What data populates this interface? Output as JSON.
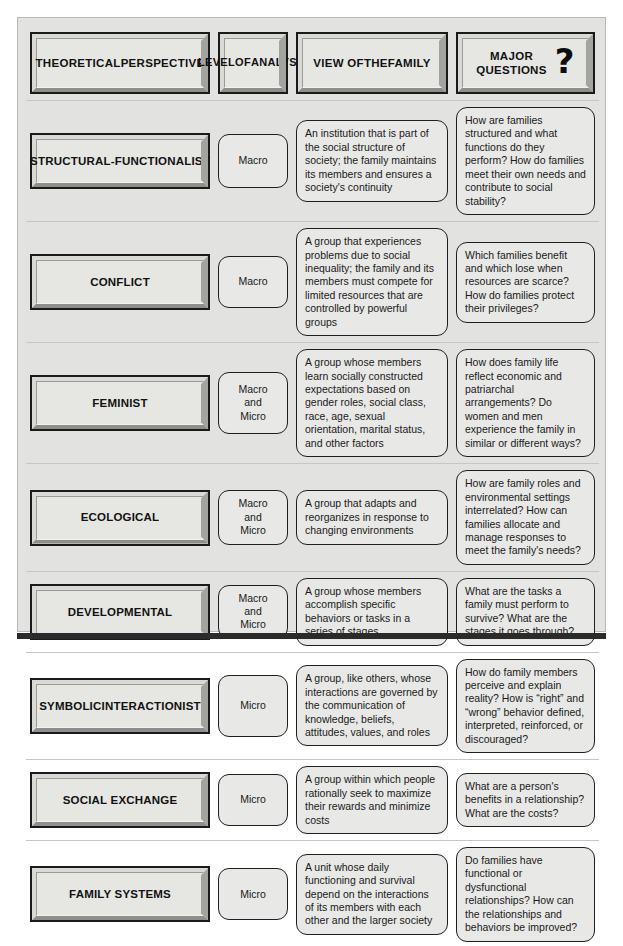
{
  "figure": {
    "colors": {
      "frame_background": "#e2e2e0",
      "box_face": "#e6e6e3",
      "box_border": "#1a1a1a",
      "pill_face": "#e8e8e6",
      "bottom_rule": "#2b2b2b"
    }
  },
  "header": {
    "columns": [
      {
        "label": "THEORETICAL\nPERSPECTIVE",
        "line1": "THEORETICAL",
        "line2": "PERSPECTIVE"
      },
      {
        "label": "LEVEL\nOF\nANALYSIS",
        "line1": "LEVEL",
        "line2": "OF",
        "line3": "ANALYSIS"
      },
      {
        "label": "VIEW OF\nTHE\nFAMILY",
        "line1": "VIEW OF",
        "line2": "THE",
        "line3": "FAMILY"
      },
      {
        "label": "MAJOR\nQUESTIONS",
        "line1": "MAJOR",
        "line2": "QUESTIONS",
        "icon": "question-mark-icon",
        "icon_glyph": "?"
      }
    ]
  },
  "rows": [
    {
      "perspective_line1": "STRUCTURAL-",
      "perspective_line2": "FUNCTIONALIST",
      "level": "Macro",
      "view": "An institution that is part of the social structure of society; the family maintains its members and ensures a society's continuity",
      "questions": "How are families structured and what functions do they perform? How do families meet their own needs and contribute to social stability?"
    },
    {
      "perspective_line1": "CONFLICT",
      "perspective_line2": "",
      "level": "Macro",
      "view": "A group that experiences problems due to social inequality; the family and its members must compete for limited resources that are controlled by powerful groups",
      "questions": "Which families benefit and which lose when resources are scarce? How do families protect their privileges?"
    },
    {
      "perspective_line1": "FEMINIST",
      "perspective_line2": "",
      "level": "Macro\nand\nMicro",
      "view": "A group whose members learn socially constructed expectations based on gender roles, social class, race, age, sexual orientation, marital status, and other factors",
      "questions": "How does family life reflect economic and patriarchal arrangements? Do women and men experience the family in similar or different ways?"
    },
    {
      "perspective_line1": "ECOLOGICAL",
      "perspective_line2": "",
      "level": "Macro\nand\nMicro",
      "view": "A group that adapts and reorganizes in response to changing environments",
      "questions": "How are family roles and environmental settings interrelated? How can families allocate and manage responses to meet the family's needs?"
    },
    {
      "perspective_line1": "DEVELOPMENTAL",
      "perspective_line2": "",
      "level": "Macro\nand\nMicro",
      "view": "A group whose members accomplish specific behaviors or tasks in a series of stages",
      "questions": "What are the tasks a family must perform to survive? What are the stages it goes through?"
    },
    {
      "perspective_line1": "SYMBOLIC",
      "perspective_line2": "INTERACTIONIST",
      "level": "Micro",
      "view": "A group, like others, whose interactions are governed by the communication of knowledge, beliefs, attitudes, values, and roles",
      "questions": "How do family members perceive and explain reality? How is “right” and “wrong” behavior defined, interpreted, reinforced, or discouraged?"
    },
    {
      "perspective_line1": "SOCIAL EXCHANGE",
      "perspective_line2": "",
      "level": "Micro",
      "view": "A group within which people rationally seek to maximize their rewards and minimize costs",
      "questions": "What are a person's benefits in a relationship? What are the costs?"
    },
    {
      "perspective_line1": "FAMILY SYSTEMS",
      "perspective_line2": "",
      "level": "Micro",
      "view": "A unit whose daily functioning and survival depend on the interactions of its members with each other and the larger society",
      "questions": "Do families have functional or dysfunctional relationships? How can the relationships and behaviors be improved?"
    }
  ]
}
